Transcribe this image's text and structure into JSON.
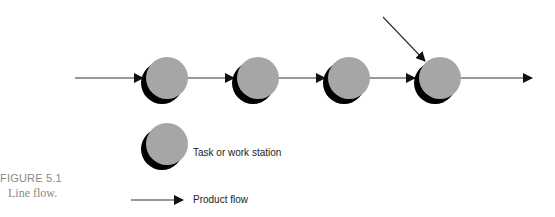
{
  "figure": {
    "label": "FIGURE 5.1",
    "caption": "Line flow."
  },
  "diagram": {
    "type": "line-flow",
    "stations": [
      {
        "id": "station-1",
        "label": "Task or work station"
      },
      {
        "id": "station-2",
        "label": "Task or work station"
      },
      {
        "id": "station-3",
        "label": "Task or work station"
      },
      {
        "id": "station-4",
        "label": "Task or work station"
      }
    ],
    "flows": [
      {
        "from": "input",
        "to": "station-1"
      },
      {
        "from": "station-1",
        "to": "station-2"
      },
      {
        "from": "station-2",
        "to": "station-3"
      },
      {
        "from": "station-3",
        "to": "station-4"
      },
      {
        "from": "side-input",
        "to": "station-4"
      },
      {
        "from": "station-4",
        "to": "output"
      }
    ]
  },
  "legend": {
    "station_label": "Task or work station",
    "flow_label": "Product flow"
  },
  "colors": {
    "station_fill": "#a6a6a6",
    "station_shadow": "#000000",
    "arrow": "#1a1a1a",
    "caption": "#8a8a8a"
  }
}
